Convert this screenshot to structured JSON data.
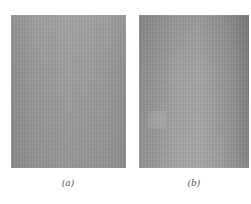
{
  "figure": {
    "panels": [
      {
        "id": "a",
        "caption": "(a)",
        "description": "uniform gray textured surface"
      },
      {
        "id": "b",
        "caption": "(b)",
        "description": "gray textured surface with darker right edge and faint lighter square patch at lower left"
      }
    ],
    "colors": {
      "panel_gray": "#9a9a9a",
      "panel_b_dark_edge": "#808080",
      "background": "#ffffff",
      "caption_text": "#555555"
    }
  }
}
